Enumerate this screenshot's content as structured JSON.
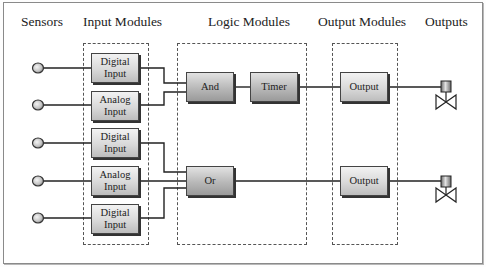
{
  "headers": {
    "sensors": "Sensors",
    "input_modules": "Input Modules",
    "logic_modules": "Logic Modules",
    "output_modules": "Output Modules",
    "outputs": "Outputs"
  },
  "input_modules": [
    {
      "label": "Digital\nInput",
      "type": "digital"
    },
    {
      "label": "Analog\nInput",
      "type": "analog"
    },
    {
      "label": "Digital\nInput",
      "type": "digital"
    },
    {
      "label": "Analog\nInput",
      "type": "analog"
    },
    {
      "label": "Digital\nInput",
      "type": "digital"
    }
  ],
  "logic_modules": {
    "and": "And",
    "timer": "Timer",
    "or": "Or"
  },
  "output_modules": [
    {
      "label": "Output"
    },
    {
      "label": "Output"
    }
  ],
  "sensors_count": 5,
  "outputs_count": 2,
  "colors": {
    "module_light": "#f2f2f2",
    "module_dark": "#bdbdbd",
    "logic_dark": "#9a9a9a",
    "wire": "#222222",
    "border": "#8a8a8a"
  }
}
